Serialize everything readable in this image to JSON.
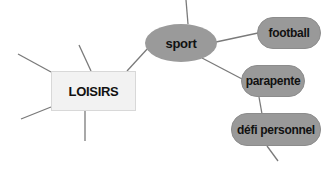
{
  "diagram": {
    "type": "mind-map",
    "colors": {
      "line": "#7a7a7a",
      "center_fill": "#f2f2f2",
      "center_border": "#d8d8d8",
      "node_fill": "#999999",
      "text": "#111111"
    },
    "center": {
      "label": "LOISIRS"
    },
    "branches": [
      {
        "id": "sport",
        "label": "sport",
        "shape": "ellipse"
      },
      {
        "id": "football",
        "label": "football",
        "shape": "pill",
        "parent": "sport"
      },
      {
        "id": "parapente",
        "label": "parapente",
        "shape": "pill",
        "parent": "sport"
      },
      {
        "id": "defi",
        "label": "défi personnel",
        "shape": "pill",
        "parent": "parapente"
      }
    ]
  }
}
